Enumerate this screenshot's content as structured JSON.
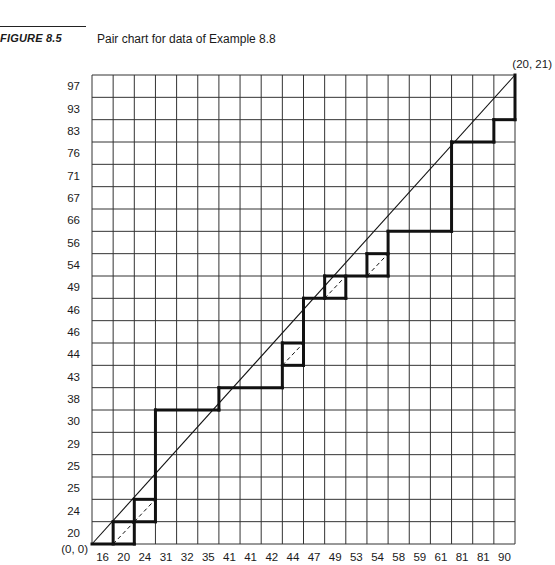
{
  "figure": {
    "label": "FIGURE 8.5",
    "caption": "Pair chart for data of Example 8.8"
  },
  "chart_data": {
    "type": "line",
    "title": "Pair chart for data of Example 8.8",
    "xlabel": "",
    "ylabel": "",
    "grid": true,
    "n_columns": 20,
    "n_rows": 21,
    "x_tick_labels": [
      "16",
      "20",
      "24",
      "31",
      "32",
      "35",
      "41",
      "41",
      "42",
      "44",
      "47",
      "49",
      "53",
      "54",
      "58",
      "59",
      "61",
      "81",
      "81",
      "90"
    ],
    "y_tick_labels": [
      "20",
      "24",
      "25",
      "25",
      "29",
      "30",
      "38",
      "43",
      "44",
      "46",
      "46",
      "49",
      "54",
      "56",
      "66",
      "67",
      "71",
      "76",
      "83",
      "93",
      "97"
    ],
    "origin_label": "(0, 0)",
    "end_label": "(20, 21)",
    "series": [
      {
        "name": "diagonal",
        "style": "solid-thin",
        "points": [
          [
            0,
            0
          ],
          [
            20,
            21
          ]
        ]
      },
      {
        "name": "pair-path",
        "style": "solid-thick",
        "segments": [
          [
            [
              0,
              0
            ],
            [
              2,
              0
            ]
          ],
          [
            [
              1,
              0
            ],
            [
              1,
              1
            ]
          ],
          [
            [
              1,
              1
            ],
            [
              3,
              1
            ]
          ],
          [
            [
              2,
              0
            ],
            [
              2,
              2
            ]
          ],
          [
            [
              2,
              2
            ],
            [
              3,
              2
            ]
          ],
          [
            [
              3,
              1
            ],
            [
              3,
              6
            ]
          ],
          [
            [
              3,
              6
            ],
            [
              6,
              6
            ]
          ],
          [
            [
              6,
              6
            ],
            [
              6,
              7
            ]
          ],
          [
            [
              6,
              7
            ],
            [
              9,
              7
            ]
          ],
          [
            [
              9,
              7
            ],
            [
              9,
              9
            ]
          ],
          [
            [
              9,
              8
            ],
            [
              10,
              8
            ]
          ],
          [
            [
              9,
              9
            ],
            [
              10,
              9
            ]
          ],
          [
            [
              10,
              8
            ],
            [
              10,
              11
            ]
          ],
          [
            [
              10,
              11
            ],
            [
              12,
              11
            ]
          ],
          [
            [
              11,
              11
            ],
            [
              11,
              12
            ]
          ],
          [
            [
              12,
              11
            ],
            [
              12,
              12
            ]
          ],
          [
            [
              11,
              12
            ],
            [
              14,
              12
            ]
          ],
          [
            [
              13,
              12
            ],
            [
              13,
              13
            ]
          ],
          [
            [
              13,
              13
            ],
            [
              14,
              13
            ]
          ],
          [
            [
              14,
              12
            ],
            [
              14,
              14
            ]
          ],
          [
            [
              14,
              14
            ],
            [
              17,
              14
            ]
          ],
          [
            [
              17,
              14
            ],
            [
              17,
              18
            ]
          ],
          [
            [
              17,
              18
            ],
            [
              19,
              18
            ]
          ],
          [
            [
              19,
              18
            ],
            [
              19,
              19
            ]
          ],
          [
            [
              19,
              19
            ],
            [
              20,
              19
            ]
          ],
          [
            [
              20,
              19
            ],
            [
              20,
              21
            ]
          ]
        ]
      },
      {
        "name": "tie-diagonals",
        "style": "dashed",
        "segments": [
          [
            [
              1,
              0
            ],
            [
              2,
              1
            ]
          ],
          [
            [
              2,
              1
            ],
            [
              3,
              2
            ]
          ],
          [
            [
              9,
              8
            ],
            [
              10,
              9
            ]
          ],
          [
            [
              11,
              11
            ],
            [
              12,
              12
            ]
          ],
          [
            [
              13,
              12
            ],
            [
              14,
              13
            ]
          ]
        ]
      }
    ]
  }
}
